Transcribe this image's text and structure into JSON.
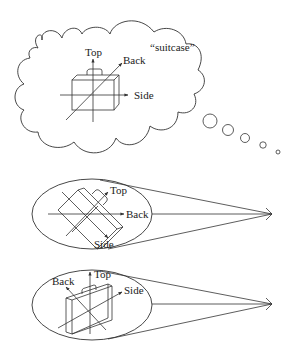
{
  "figure": {
    "thought": {
      "word_label": "“suitcase”",
      "axes_labels": {
        "top": "Top",
        "back": "Back",
        "side": "Side"
      },
      "bubble_count": 5
    },
    "view_upper": {
      "axes_labels": {
        "top": "Top",
        "back": "Back",
        "side": "Side"
      }
    },
    "view_lower": {
      "axes_labels": {
        "top": "Top",
        "back": "Back",
        "side": "Side"
      }
    },
    "colors": {
      "line": "#333333",
      "background": "#ffffff",
      "text": "#222222"
    }
  }
}
